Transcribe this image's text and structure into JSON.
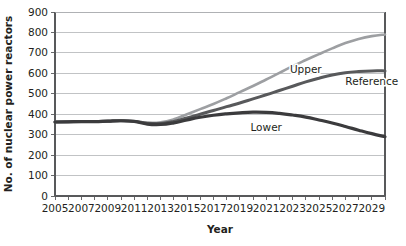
{
  "chart_data": {
    "type": "line",
    "title": "",
    "xlabel": "Year",
    "ylabel": "No. of nuclear power reactors",
    "xlim": [
      2005,
      2030
    ],
    "ylim": [
      0,
      900
    ],
    "grid": true,
    "legend_position": "inline-labels",
    "y_ticks": [
      0,
      100,
      200,
      300,
      400,
      500,
      600,
      700,
      800,
      900
    ],
    "y_tick_labels": [
      "0",
      "100",
      "200",
      "300",
      "400",
      "500",
      "600",
      "700",
      "800",
      "900"
    ],
    "x_ticks": [
      2005,
      2006,
      2007,
      2008,
      2009,
      2010,
      2011,
      2012,
      2013,
      2014,
      2015,
      2016,
      2017,
      2018,
      2019,
      2020,
      2021,
      2022,
      2023,
      2024,
      2025,
      2026,
      2027,
      2028,
      2029,
      2030
    ],
    "x_tick_labels": [
      "2005",
      "",
      "2007",
      "",
      "2009",
      "",
      "2011",
      "",
      "2013",
      "",
      "2015",
      "",
      "2017",
      "",
      "2019",
      "",
      "2021",
      "",
      "2023",
      "",
      "2025",
      "",
      "2027",
      "",
      "2029",
      ""
    ],
    "x": [
      2005,
      2006,
      2007,
      2008,
      2009,
      2010,
      2011,
      2012,
      2013,
      2014,
      2015,
      2016,
      2017,
      2018,
      2019,
      2020,
      2021,
      2022,
      2023,
      2024,
      2025,
      2026,
      2027,
      2028,
      2029,
      2030
    ],
    "series": [
      {
        "name": "Upper",
        "color": "#9d9fa2",
        "width": 2.6,
        "label_x": 2024,
        "label_y": 600,
        "values": [
          362,
          363,
          364,
          364,
          366,
          368,
          365,
          358,
          360,
          375,
          400,
          425,
          450,
          478,
          508,
          538,
          570,
          602,
          635,
          665,
          694,
          722,
          748,
          768,
          782,
          790
        ]
      },
      {
        "name": "Reference",
        "color": "#58595b",
        "width": 3.0,
        "label_x": 2029,
        "label_y": 545,
        "values": [
          362,
          363,
          364,
          364,
          366,
          368,
          365,
          356,
          355,
          365,
          382,
          400,
          418,
          437,
          455,
          475,
          495,
          516,
          537,
          558,
          576,
          592,
          603,
          609,
          612,
          612
        ]
      },
      {
        "name": "Lower",
        "color": "#3b3b3d",
        "width": 3.2,
        "label_x": 2021,
        "label_y": 320,
        "values": [
          362,
          363,
          364,
          364,
          366,
          368,
          365,
          352,
          350,
          358,
          372,
          385,
          395,
          402,
          407,
          410,
          409,
          404,
          396,
          386,
          372,
          357,
          340,
          322,
          305,
          290
        ]
      }
    ]
  },
  "layout": {
    "plot_left": 55,
    "plot_right": 385,
    "plot_top": 12,
    "plot_bottom": 196
  }
}
